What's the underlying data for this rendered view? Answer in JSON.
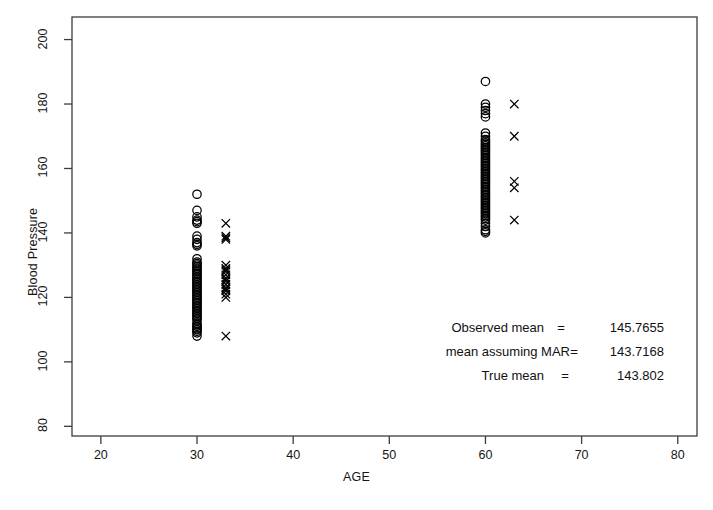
{
  "chart_data": {
    "type": "scatter",
    "title": "",
    "xlabel": "AGE",
    "ylabel": "Blood Pressure",
    "xlim": [
      17,
      82
    ],
    "ylim": [
      77,
      207
    ],
    "xticks": [
      20,
      30,
      40,
      50,
      60,
      70,
      80
    ],
    "yticks": [
      80,
      100,
      120,
      140,
      160,
      180,
      200
    ],
    "grid": false,
    "legend": null,
    "series": [
      {
        "name": "observed",
        "marker": "circle",
        "points": [
          [
            30,
            152
          ],
          [
            30,
            147
          ],
          [
            30,
            145
          ],
          [
            30,
            144
          ],
          [
            30,
            143.5
          ],
          [
            30,
            143
          ],
          [
            30,
            139
          ],
          [
            30,
            138
          ],
          [
            30,
            137
          ],
          [
            30,
            136.5
          ],
          [
            30,
            136
          ],
          [
            30,
            132
          ],
          [
            30,
            131
          ],
          [
            30,
            130.5
          ],
          [
            30,
            130
          ],
          [
            30,
            129.5
          ],
          [
            30,
            129
          ],
          [
            30,
            128.5
          ],
          [
            30,
            128
          ],
          [
            30,
            127.5
          ],
          [
            30,
            127
          ],
          [
            30,
            126.5
          ],
          [
            30,
            126
          ],
          [
            30,
            125.5
          ],
          [
            30,
            125
          ],
          [
            30,
            124.5
          ],
          [
            30,
            124
          ],
          [
            30,
            123.5
          ],
          [
            30,
            123
          ],
          [
            30,
            122.5
          ],
          [
            30,
            122
          ],
          [
            30,
            121.5
          ],
          [
            30,
            121
          ],
          [
            30,
            120.5
          ],
          [
            30,
            120
          ],
          [
            30,
            119.5
          ],
          [
            30,
            119
          ],
          [
            30,
            118.5
          ],
          [
            30,
            118
          ],
          [
            30,
            117.5
          ],
          [
            30,
            117
          ],
          [
            30,
            116.5
          ],
          [
            30,
            116
          ],
          [
            30,
            115.5
          ],
          [
            30,
            115
          ],
          [
            30,
            114.5
          ],
          [
            30,
            114
          ],
          [
            30,
            113.5
          ],
          [
            30,
            113
          ],
          [
            30,
            112
          ],
          [
            30,
            111.5
          ],
          [
            30,
            111
          ],
          [
            30,
            110.5
          ],
          [
            30,
            110
          ],
          [
            30,
            109.5
          ],
          [
            30,
            109
          ],
          [
            30,
            108
          ],
          [
            60,
            187
          ],
          [
            60,
            180
          ],
          [
            60,
            179
          ],
          [
            60,
            178
          ],
          [
            60,
            177
          ],
          [
            60,
            176
          ],
          [
            60,
            171
          ],
          [
            60,
            170
          ],
          [
            60,
            169
          ],
          [
            60,
            168.5
          ],
          [
            60,
            168
          ],
          [
            60,
            167.5
          ],
          [
            60,
            167
          ],
          [
            60,
            166.5
          ],
          [
            60,
            166
          ],
          [
            60,
            165.5
          ],
          [
            60,
            165
          ],
          [
            60,
            164.5
          ],
          [
            60,
            164
          ],
          [
            60,
            163.5
          ],
          [
            60,
            163
          ],
          [
            60,
            162.5
          ],
          [
            60,
            162
          ],
          [
            60,
            161.5
          ],
          [
            60,
            161
          ],
          [
            60,
            160.5
          ],
          [
            60,
            160
          ],
          [
            60,
            159.5
          ],
          [
            60,
            159
          ],
          [
            60,
            158.5
          ],
          [
            60,
            158
          ],
          [
            60,
            157.5
          ],
          [
            60,
            157
          ],
          [
            60,
            156.5
          ],
          [
            60,
            156
          ],
          [
            60,
            155.5
          ],
          [
            60,
            155
          ],
          [
            60,
            154.5
          ],
          [
            60,
            154
          ],
          [
            60,
            153.5
          ],
          [
            60,
            153
          ],
          [
            60,
            152.5
          ],
          [
            60,
            152
          ],
          [
            60,
            151.5
          ],
          [
            60,
            151
          ],
          [
            60,
            150.5
          ],
          [
            60,
            150
          ],
          [
            60,
            149.5
          ],
          [
            60,
            149
          ],
          [
            60,
            148.5
          ],
          [
            60,
            148
          ],
          [
            60,
            147.5
          ],
          [
            60,
            147
          ],
          [
            60,
            146.5
          ],
          [
            60,
            146
          ],
          [
            60,
            145.5
          ],
          [
            60,
            145
          ],
          [
            60,
            144.5
          ],
          [
            60,
            144
          ],
          [
            60,
            143
          ],
          [
            60,
            142
          ],
          [
            60,
            141
          ],
          [
            60,
            140.5
          ],
          [
            60,
            140
          ]
        ]
      },
      {
        "name": "missing",
        "marker": "cross",
        "points": [
          [
            33,
            143
          ],
          [
            33,
            139
          ],
          [
            33,
            138.5
          ],
          [
            33,
            138
          ],
          [
            33,
            130
          ],
          [
            33,
            129
          ],
          [
            33,
            128.5
          ],
          [
            33,
            128
          ],
          [
            33,
            127
          ],
          [
            33,
            126
          ],
          [
            33,
            125.5
          ],
          [
            33,
            125
          ],
          [
            33,
            124
          ],
          [
            33,
            123
          ],
          [
            33,
            122.5
          ],
          [
            33,
            122
          ],
          [
            33,
            121
          ],
          [
            33,
            120
          ],
          [
            33,
            108
          ],
          [
            63,
            180
          ],
          [
            63,
            170
          ],
          [
            63,
            156
          ],
          [
            63,
            154
          ],
          [
            63,
            144
          ]
        ]
      }
    ],
    "annotations": [
      {
        "label": "Observed mean",
        "eq": "=",
        "value": "145.7655"
      },
      {
        "label": "mean assuming MAR",
        "eq": "=",
        "value": "143.7168"
      },
      {
        "label": "True mean",
        "eq": "=",
        "value": "143.802"
      }
    ]
  }
}
